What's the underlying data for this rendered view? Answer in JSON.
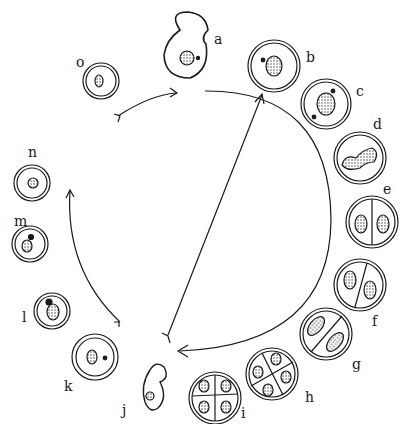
{
  "diagram": {
    "type": "cell life cycle",
    "stages": [
      {
        "id": "a",
        "label": "a",
        "desc": "amoeboid cell with nucleus and dot"
      },
      {
        "id": "b",
        "label": "b",
        "desc": "encysted cell, nucleus with dot"
      },
      {
        "id": "c",
        "label": "c",
        "desc": "cyst, nucleus with two dots"
      },
      {
        "id": "d",
        "label": "d",
        "desc": "cyst, dividing elongated nucleus"
      },
      {
        "id": "e",
        "label": "e",
        "desc": "cyst divided into two"
      },
      {
        "id": "f",
        "label": "f",
        "desc": "two-cell cyst, nuclei with dots"
      },
      {
        "id": "g",
        "label": "g",
        "desc": "two-cell cyst, elongated nuclei"
      },
      {
        "id": "h",
        "label": "h",
        "desc": "four-cell cyst"
      },
      {
        "id": "i",
        "label": "i",
        "desc": "four-cell cyst, budding nuclei"
      },
      {
        "id": "j",
        "label": "j",
        "desc": "released amoeboid cell"
      },
      {
        "id": "k",
        "label": "k",
        "desc": "cyst with nucleus and dot"
      },
      {
        "id": "l",
        "label": "l",
        "desc": "cyst with budding nucleus"
      },
      {
        "id": "m",
        "label": "m",
        "desc": "cyst with nucleus and two dots"
      },
      {
        "id": "n",
        "label": "n",
        "desc": "cyst with nucleus"
      },
      {
        "id": "o",
        "label": "o",
        "desc": "cyst with nucleus and dot"
      }
    ]
  }
}
